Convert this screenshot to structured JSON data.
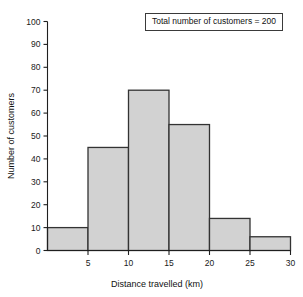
{
  "figure": {
    "kind": "histogram-figure",
    "background_color": "#ffffff"
  },
  "legend": {
    "text": "Total number of customers = 200"
  },
  "axes": {
    "y_title": "Number of customers",
    "x_title": "Distance travelled (km)",
    "y_ticks": [
      "0",
      "10",
      "20",
      "30",
      "40",
      "50",
      "60",
      "70",
      "80",
      "90",
      "100"
    ],
    "x_ticks": [
      "5",
      "10",
      "15",
      "20",
      "25",
      "30"
    ]
  },
  "chart_data": {
    "type": "bar",
    "title": "",
    "subtitle": "",
    "xlabel": "Distance travelled (km)",
    "ylabel": "Number of customers",
    "xlim": [
      0,
      30
    ],
    "ylim": [
      0,
      100
    ],
    "xticks": [
      5,
      10,
      15,
      20,
      25,
      30
    ],
    "yticks": [
      0,
      10,
      20,
      30,
      40,
      50,
      60,
      70,
      80,
      90,
      100
    ],
    "grid": false,
    "legend_position": "top-right",
    "bin_width": 5,
    "bin_edges": [
      0,
      5,
      10,
      15,
      20,
      25,
      30
    ],
    "categories": [
      "0-5",
      "5-10",
      "10-15",
      "15-20",
      "20-25",
      "25-30"
    ],
    "values": [
      10,
      45,
      70,
      55,
      14,
      6
    ],
    "bar_color": "#d2d2d2",
    "bar_edge_color": "#333333",
    "annotations": [
      "Total number of customers = 200"
    ],
    "total": 200
  }
}
